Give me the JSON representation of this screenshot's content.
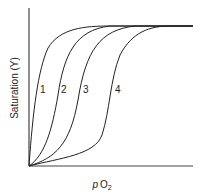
{
  "diagram": {
    "y_axis_label": "Saturation (Y)",
    "x_axis_label_main": "p",
    "x_axis_label_sub1": "O",
    "x_axis_label_sub2": "2",
    "curves": [
      {
        "label": "1"
      },
      {
        "label": "2"
      },
      {
        "label": "3"
      },
      {
        "label": "4"
      }
    ],
    "line_color": "#222222"
  }
}
